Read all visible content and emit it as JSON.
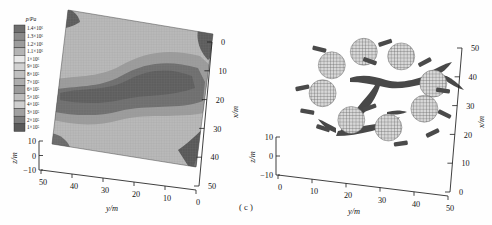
{
  "figure": {
    "caption": "( c )",
    "panels": [
      "left-contour-panel",
      "right-scatter-panel"
    ]
  },
  "colorbar": {
    "title": "p/Pa",
    "labels": [
      "1.4×10⁶",
      "1.3×10⁶",
      "1.2×10⁶",
      "1.1×10⁶",
      "1×10⁶",
      "9×10⁵",
      "8×10⁵",
      "7×10⁵",
      "6×10⁵",
      "5×10⁵",
      "4×10⁵",
      "3×10⁵",
      "2×10⁵",
      "1×10⁵"
    ],
    "swatches": [
      "#6e6e6e",
      "#8a8a8a",
      "#9c9c9c",
      "#b4b4b4",
      "#e8e8e8",
      "#d2d2d2",
      "#c0c0c0",
      "#adadad",
      "#9a9a9a",
      "#bdbdbd",
      "#cfcfcf",
      "#a0a0a0",
      "#7c7c7c",
      "#5a5a5a"
    ]
  },
  "left_axes": {
    "y_label": "y/m",
    "y_ticks": [
      "50",
      "40",
      "30",
      "20",
      "10",
      "0"
    ],
    "x_label": "x/m",
    "x_ticks": [
      "0",
      "10",
      "20",
      "30",
      "40",
      "50"
    ],
    "z_label": "z/m",
    "z_ticks": [
      "10",
      "0",
      "−10"
    ]
  },
  "right_axes": {
    "y_label": "y/m",
    "y_ticks": [
      "0",
      "10",
      "20",
      "30",
      "40",
      "50"
    ],
    "x_label": "x/m",
    "x_ticks": [
      "50",
      "40",
      "30",
      "20",
      "10",
      "0"
    ],
    "z_label": "z/m",
    "z_ticks": [
      "10",
      "0",
      "−10"
    ]
  },
  "chart_data": [
    {
      "id": "left-contour-panel",
      "type": "heatmap",
      "title": "",
      "quantity": "p/Pa",
      "xlabel": "y/m",
      "ylabel": "x/m",
      "zlabel": "z/m",
      "projection": "3d-surface",
      "xlim": [
        0,
        50
      ],
      "ylim": [
        0,
        50
      ],
      "zlim": [
        -10,
        10
      ],
      "grid": false,
      "colormap": "grayscale-14-band",
      "legend_position": "left-outside",
      "levels": [
        100000,
        200000,
        300000,
        400000,
        500000,
        600000,
        700000,
        800000,
        900000,
        1000000,
        1100000,
        1200000,
        1300000,
        1400000
      ],
      "level_labels": [
        "1×10⁵",
        "2×10⁵",
        "3×10⁵",
        "4×10⁵",
        "5×10⁵",
        "6×10⁵",
        "7×10⁵",
        "8×10⁵",
        "9×10⁵",
        "1×10⁶",
        "1.1×10⁶",
        "1.2×10⁶",
        "1.3×10⁶",
        "1.4×10⁶"
      ],
      "features": [
        {
          "name": "central-high-pressure-band",
          "value": 1300000,
          "extent_y": [
            5,
            45
          ],
          "extent_x": [
            12,
            30
          ]
        },
        {
          "name": "upper-left-corner-patch",
          "value": 1400000,
          "extent_y": [
            42,
            50
          ],
          "extent_x": [
            0,
            6
          ]
        },
        {
          "name": "upper-right-corner-patch",
          "value": 1400000,
          "extent_y": [
            0,
            8
          ],
          "extent_x": [
            0,
            7
          ]
        },
        {
          "name": "lower-right-corner-patch",
          "value": 1400000,
          "extent_y": [
            0,
            10
          ],
          "extent_x": [
            42,
            50
          ]
        },
        {
          "name": "lower-left-corner-patch",
          "value": 1300000,
          "extent_y": [
            46,
            50
          ],
          "extent_x": [
            40,
            50
          ]
        },
        {
          "name": "background-field",
          "value": 600000
        }
      ]
    },
    {
      "id": "right-scatter-panel",
      "type": "scatter",
      "title": "",
      "xlabel": "y/m",
      "ylabel": "x/m",
      "zlabel": "z/m",
      "projection": "3d-scatter",
      "xlim": [
        0,
        50
      ],
      "ylim": [
        0,
        50
      ],
      "zlim": [
        -10,
        10
      ],
      "grid": false,
      "legend_position": "none",
      "series": [
        {
          "name": "hatched-discs",
          "marker": "crosshatched-circle",
          "count": 8,
          "points": [
            {
              "y": 22,
              "x": 46
            },
            {
              "y": 33,
              "x": 46
            },
            {
              "y": 13,
              "x": 40
            },
            {
              "y": 43,
              "x": 38
            },
            {
              "y": 11,
              "x": 30
            },
            {
              "y": 41,
              "x": 29
            },
            {
              "y": 20,
              "x": 22
            },
            {
              "y": 31,
              "x": 21
            }
          ]
        },
        {
          "name": "dark-bar-markers",
          "marker": "short-bar",
          "count": 12,
          "points": [
            {
              "y": 28,
              "x": 50
            },
            {
              "y": 9,
              "x": 45
            },
            {
              "y": 40,
              "x": 45
            },
            {
              "y": 24,
              "x": 43
            },
            {
              "y": 46,
              "x": 36
            },
            {
              "y": 5,
              "x": 31
            },
            {
              "y": 47,
              "x": 28
            },
            {
              "y": 25,
              "x": 27
            },
            {
              "y": 7,
              "x": 23
            },
            {
              "y": 44,
              "x": 21
            },
            {
              "y": 12,
              "x": 18
            },
            {
              "y": 35,
              "x": 16
            }
          ]
        },
        {
          "name": "central-streak-structure",
          "marker": "branching-ribbon",
          "count": 1,
          "points": [
            {
              "y": 27,
              "x": 33
            }
          ]
        }
      ]
    }
  ]
}
